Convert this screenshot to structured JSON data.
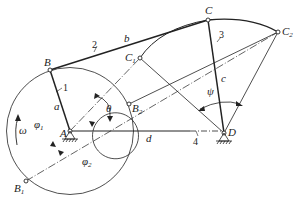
{
  "figure": {
    "points": {
      "A": {
        "label": "A",
        "x": 70,
        "y": 131
      },
      "B": {
        "label": "B",
        "x": 50,
        "y": 70
      },
      "B1": {
        "label": "B",
        "sub": "1",
        "x": 26,
        "y": 181
      },
      "B2": {
        "label": "B",
        "sub": "2",
        "x": 129,
        "y": 104
      },
      "C": {
        "label": "C",
        "x": 208,
        "y": 20
      },
      "C1": {
        "label": "C",
        "sub": "1",
        "x": 140,
        "y": 58
      },
      "C2": {
        "label": "C",
        "sub": "2",
        "x": 278,
        "y": 32
      },
      "D": {
        "label": "D",
        "x": 224,
        "y": 133
      }
    },
    "link_numbers": {
      "crank": "1",
      "coupler": "2",
      "rocker": "3",
      "frame": "4"
    },
    "link_lengths": {
      "a": "a",
      "b": "b",
      "c": "c",
      "d": "d"
    },
    "angles": {
      "theta": "θ",
      "psi": "ψ",
      "phi1": "φ",
      "phi1_sub": "1",
      "phi2": "φ",
      "phi2_sub": "2",
      "omega": "ω"
    },
    "colors": {
      "stroke": "#222222",
      "background": "#ffffff"
    }
  }
}
